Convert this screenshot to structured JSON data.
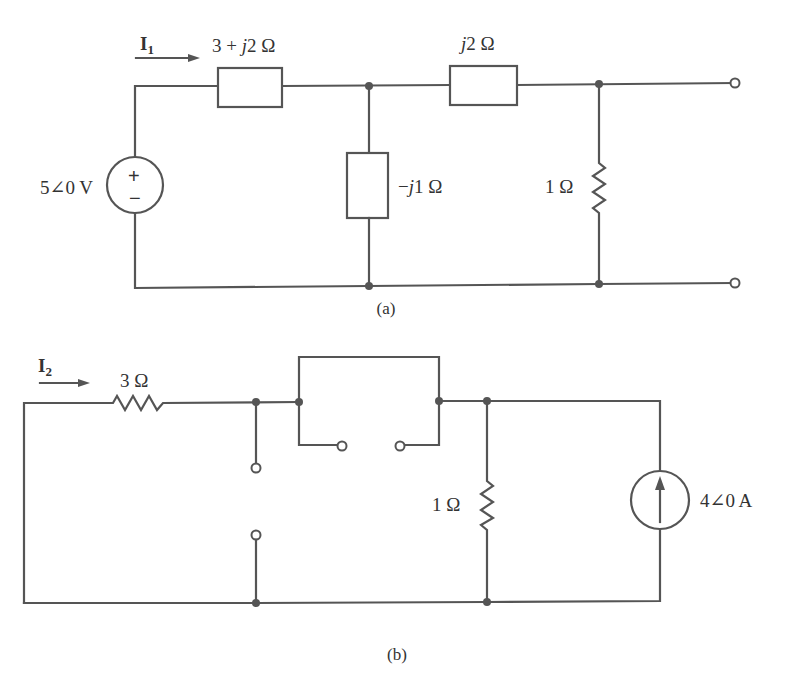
{
  "figure_a": {
    "caption": "(a)",
    "current_label": "I",
    "current_subscript": "1",
    "source_label": "5∠0 V",
    "source_plus": "+",
    "source_minus": "−",
    "z_series1_label_pre": "3 + ",
    "z_series1_label_j": "j",
    "z_series1_label_post": "2 Ω",
    "z_series2_label_j": "j",
    "z_series2_label_post": "2 Ω",
    "z_shunt_label_pre": "−",
    "z_shunt_label_j": "j",
    "z_shunt_label_post": "1 Ω",
    "r_load_label": "1 Ω"
  },
  "figure_b": {
    "caption": "(b)",
    "current_label": "I",
    "current_subscript": "2",
    "r_series_label": "3 Ω",
    "r_shunt_label": "1 Ω",
    "source_label": "4∠0 A"
  },
  "colors": {
    "line": "#555555",
    "text": "#333333",
    "background": "#ffffff"
  }
}
